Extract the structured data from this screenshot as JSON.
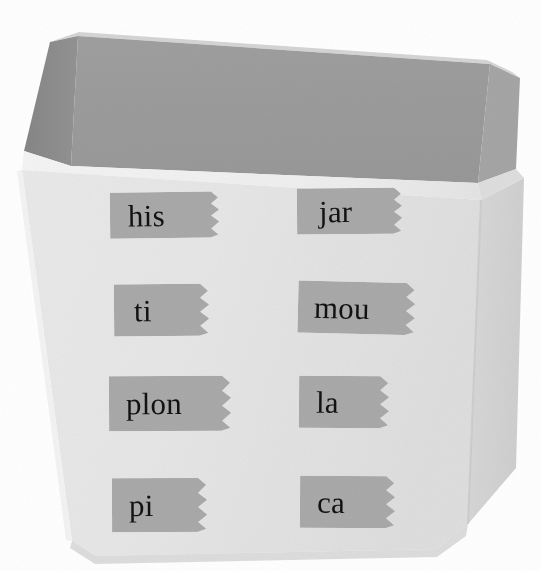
{
  "scene": {
    "title": "Open cardboard box with eight taped word labels",
    "background_color": "#ffffff"
  },
  "box": {
    "name": "open-top-box",
    "front_panel_color": "#e6e6e6",
    "right_panel_color": "#d4d4d4",
    "interior_back_color": "#9b9b9b",
    "interior_left_color": "#8c8c8c",
    "rim_color": "#f0f0f0",
    "rim_right_color": "#dcdcdc",
    "edge_shadow_color": "#c9c9c9"
  },
  "labels": {
    "tape_color": "#a9a9a9",
    "tape_color_dark": "#9e9e9e",
    "text_color": "#121212",
    "columns": 2,
    "rows": 4,
    "items": [
      {
        "id": "label-his",
        "text": "his",
        "row": 1,
        "column": 1,
        "x": 110,
        "y": 192,
        "width": 120,
        "height": 46,
        "font_size": 31,
        "text_offset": 18,
        "rotation": -0.6
      },
      {
        "id": "label-jar",
        "text": "jar",
        "row": 1,
        "column": 2,
        "x": 297,
        "y": 188,
        "width": 115,
        "height": 46,
        "font_size": 31,
        "text_offset": 22,
        "rotation": -0.4
      },
      {
        "id": "label-ti",
        "text": "ti",
        "row": 2,
        "column": 1,
        "x": 114,
        "y": 284,
        "width": 104,
        "height": 52,
        "font_size": 31,
        "text_offset": 20,
        "rotation": -0.5
      },
      {
        "id": "label-mou",
        "text": "mou",
        "row": 2,
        "column": 2,
        "x": 298,
        "y": 282,
        "width": 127,
        "height": 52,
        "font_size": 31,
        "text_offset": 16,
        "rotation": 1.4
      },
      {
        "id": "label-plon",
        "text": "plon",
        "row": 3,
        "column": 1,
        "x": 109,
        "y": 376,
        "width": 133,
        "height": 55,
        "font_size": 31,
        "text_offset": 17,
        "rotation": -0.3
      },
      {
        "id": "label-la",
        "text": "la",
        "row": 3,
        "column": 2,
        "x": 299,
        "y": 376,
        "width": 98,
        "height": 52,
        "font_size": 31,
        "text_offset": 17,
        "rotation": 0.4
      },
      {
        "id": "label-pi",
        "text": "pi",
        "row": 4,
        "column": 1,
        "x": 112,
        "y": 478,
        "width": 104,
        "height": 54,
        "font_size": 31,
        "text_offset": 17,
        "rotation": -0.2
      },
      {
        "id": "label-ca",
        "text": "ca",
        "row": 4,
        "column": 2,
        "x": 300,
        "y": 476,
        "width": 104,
        "height": 52,
        "font_size": 31,
        "text_offset": 17,
        "rotation": 0.3
      }
    ]
  }
}
